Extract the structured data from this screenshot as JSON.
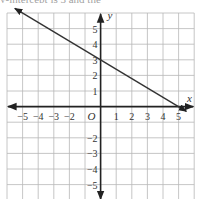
{
  "top_text": "y-intercept is 3 and the",
  "chart_data": {
    "type": "line",
    "title": "",
    "xlabel": "x",
    "ylabel": "y",
    "origin_label": "O",
    "xlim": [
      -6,
      6
    ],
    "ylim": [
      -6,
      6
    ],
    "grid": true,
    "x_tick_labels": [
      "-5",
      "-4",
      "-3",
      "-2",
      "1",
      "2",
      "3",
      "4",
      "5"
    ],
    "y_tick_labels": [
      "5",
      "4",
      "3",
      "2",
      "1",
      "-2",
      "-3",
      "-4",
      "-5"
    ],
    "series": [
      {
        "name": "line",
        "equation": "y = -0.6x + 3",
        "slope": -0.6,
        "intercept": 3,
        "points": [
          [
            -5.5,
            6.3
          ],
          [
            0,
            3
          ],
          [
            5,
            0
          ],
          [
            5.5,
            -0.3
          ]
        ],
        "arrows_both_ends": true
      }
    ]
  },
  "colors": {
    "grid": "#b8b8b8",
    "axes": "#222222",
    "line": "#333333"
  }
}
